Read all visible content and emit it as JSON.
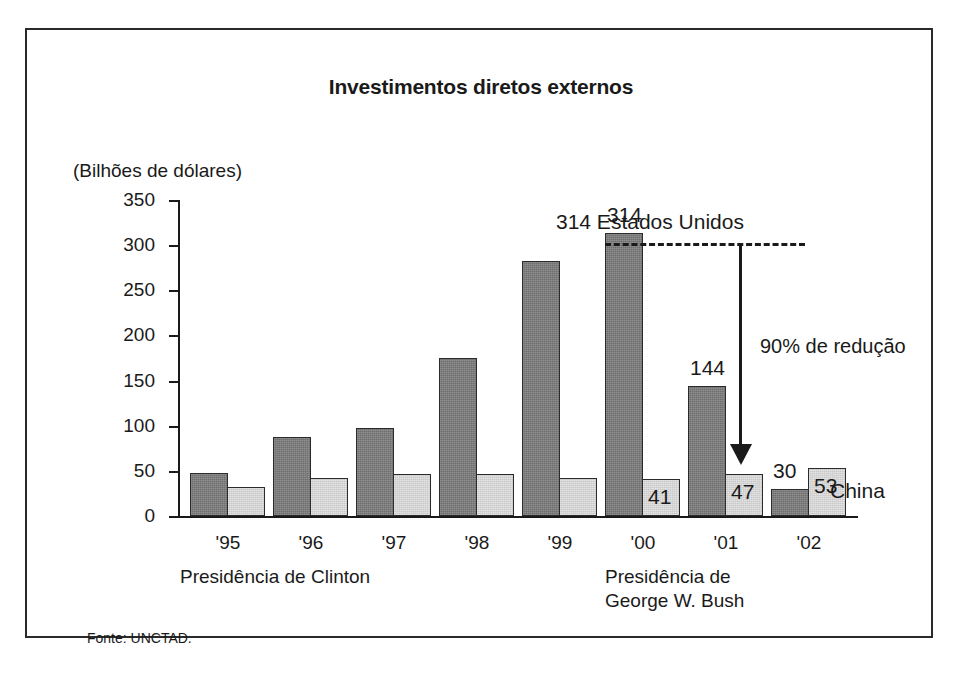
{
  "figure": {
    "title": "Investimentos diretos externos",
    "unit_label": "(Bilhões de dólares)",
    "source": "Fonte: UNCTAD."
  },
  "annotations": {
    "us_peak": "314 Estados Unidos",
    "reduction": "90% de redução",
    "china_series": "China",
    "presidency_clinton": "Presidência de Clinton",
    "presidency_bush": "Presidência de\nGeorge W. Bush"
  },
  "colors": {
    "estados_unidos": "#6e6e6e",
    "china": "#c9c9c9",
    "axis": "#1a1a1a",
    "frame": "#2a2a2a"
  },
  "chart_data": {
    "type": "bar",
    "title": "Investimentos diretos externos",
    "subtitle": "",
    "xlabel": "",
    "ylabel": "(Bilhões de dólares)",
    "ylim": [
      0,
      350
    ],
    "yticks": [
      0,
      50,
      100,
      150,
      200,
      250,
      300,
      350
    ],
    "ytick_labels": [
      "0",
      "50",
      "100",
      "150",
      "200",
      "250",
      "300",
      "350"
    ],
    "grid": false,
    "legend_position": "inline-annotation",
    "categories": [
      "'95",
      "'96",
      "'97",
      "'98",
      "'99",
      "'00",
      "'01",
      "'02"
    ],
    "series": [
      {
        "name": "Estados Unidos",
        "color": "#6e6e6e",
        "values": [
          48,
          87,
          98,
          175,
          282,
          314,
          144,
          30
        ],
        "data_labels": [
          "",
          "",
          "",
          "",
          "",
          "314",
          "144",
          "30"
        ]
      },
      {
        "name": "China",
        "color": "#c9c9c9",
        "values": [
          32,
          42,
          46,
          46,
          42,
          41,
          47,
          53
        ],
        "data_labels": [
          "",
          "",
          "",
          "",
          "",
          "41",
          "47",
          "53"
        ]
      }
    ],
    "annotations": [
      {
        "text": "314 Estados Unidos",
        "target": "'00 Estados Unidos bar top"
      },
      {
        "text": "90% de redução",
        "target": "arrow from 314 down to 30"
      },
      {
        "text": "China",
        "target": "'02 China bar"
      },
      {
        "text": "Presidência de Clinton",
        "target": "'95-'99"
      },
      {
        "text": "Presidência de George W. Bush",
        "target": "'00-'02"
      }
    ]
  }
}
